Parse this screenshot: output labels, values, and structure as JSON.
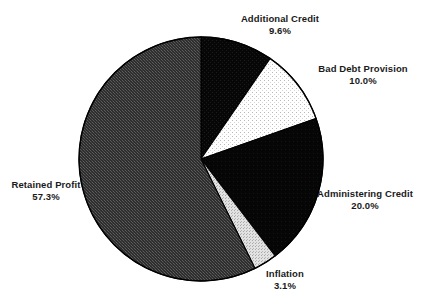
{
  "chart_data": {
    "type": "pie",
    "title": "",
    "subtitle": "",
    "xlabel": "",
    "ylabel": "",
    "legend_position": "labels-outside",
    "grid": false,
    "start_angle_deg": 0,
    "direction": "clockwise",
    "categories": [
      "Additional Credit",
      "Bad Debt Provision",
      "Administering Credit",
      "Inflation",
      "Retained Profit"
    ],
    "values": [
      9.6,
      10.0,
      20.0,
      3.1,
      57.3
    ],
    "value_labels": [
      "9.6%",
      "10.0%",
      "20.0%",
      "3.1%",
      "57.3%"
    ],
    "units": "percent",
    "total": 100.0,
    "slices": [
      {
        "name": "Additional Credit",
        "value": 9.6,
        "value_label": "9.6%",
        "fill": "#0a0a0a",
        "pattern": "solid-black-fine-dots",
        "start_deg": 0.0,
        "end_deg": 34.56
      },
      {
        "name": "Bad Debt Provision",
        "value": 10.0,
        "value_label": "10.0%",
        "fill": "#ffffff",
        "pattern": "white-sparse-dots",
        "start_deg": 34.56,
        "end_deg": 70.56
      },
      {
        "name": "Administering Credit",
        "value": 20.0,
        "value_label": "20.0%",
        "fill": "#0a0a0a",
        "pattern": "solid-black",
        "start_deg": 70.56,
        "end_deg": 142.56
      },
      {
        "name": "Inflation",
        "value": 3.1,
        "value_label": "3.1%",
        "fill": "#cfcfcf",
        "pattern": "light-grey-dots",
        "start_deg": 142.56,
        "end_deg": 153.72
      },
      {
        "name": "Retained Profit",
        "value": 57.3,
        "value_label": "57.3%",
        "fill": "#3c3c3c",
        "pattern": "dark-grey-crosshatch",
        "start_deg": 153.72,
        "end_deg": 360.0
      }
    ],
    "geometry": {
      "center_x": 201,
      "center_y": 159,
      "radius": 122
    },
    "colors": {
      "background": "#ffffff",
      "outline": "#000000",
      "text": "#1a1a1a",
      "black_slice": "#0a0a0a",
      "white_slice": "#ffffff",
      "grey_slice": "#3c3c3c",
      "light_grey_slice": "#cfcfcf"
    }
  },
  "labels": {
    "additional_credit": {
      "name": "Additional Credit",
      "value": "9.6%"
    },
    "bad_debt_provision": {
      "name": "Bad Debt Provision",
      "value": "10.0%"
    },
    "administering_credit": {
      "name": "Administering Credit",
      "value": "20.0%"
    },
    "inflation": {
      "name": "Inflation",
      "value": "3.1%"
    },
    "retained_profit": {
      "name": "Retained Profit",
      "value": "57.3%"
    }
  }
}
